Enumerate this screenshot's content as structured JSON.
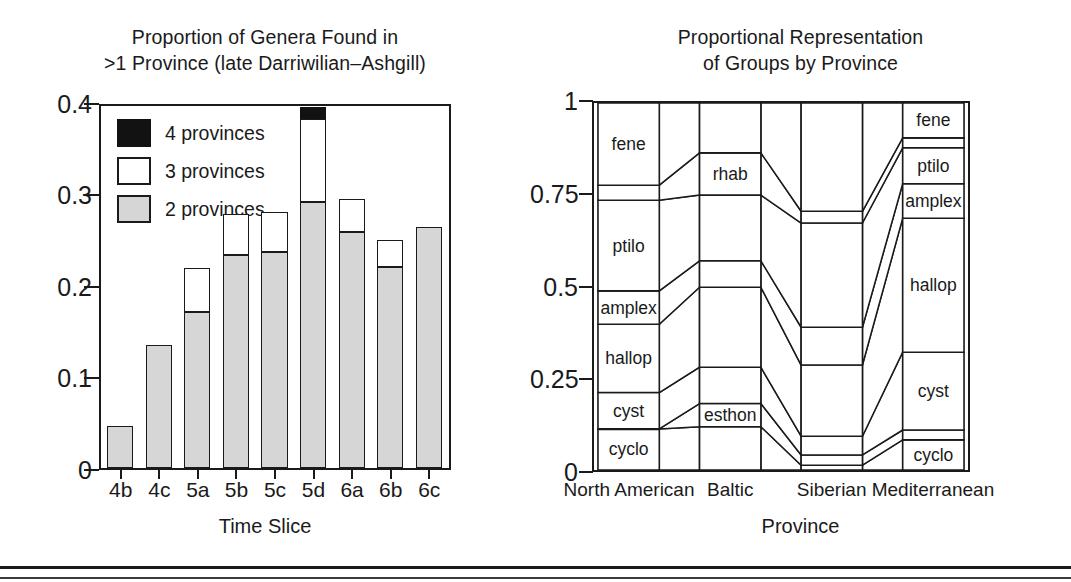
{
  "figure": {
    "panels": [
      "left-bar-chart",
      "right-mosaic-chart"
    ]
  },
  "left": {
    "title_line1": "Proportion of Genera Found in",
    "title_line2": ">1 Province (late Darriwilian–Ashgill)",
    "xlabel": "Time Slice",
    "yticks": [
      "0.4",
      "0.3",
      "0.2",
      "0.1",
      "0"
    ],
    "legend": [
      {
        "key": "g4",
        "label": "4 provinces",
        "color": "#121212"
      },
      {
        "key": "g3",
        "label": "3 provinces",
        "color": "#ffffff"
      },
      {
        "key": "g2",
        "label": "2 provinces",
        "color": "#d6d6d6"
      }
    ]
  },
  "right": {
    "title_line1": "Proportional Representation",
    "title_line2": "of Groups by Province",
    "xlabel": "Province",
    "yticks": [
      "1",
      "0.75",
      "0.5",
      "0.25",
      "0"
    ]
  },
  "chart_data": [
    {
      "type": "bar",
      "id": "proportion-of-genera",
      "title": "Proportion of Genera Found in >1 Province (late Darriwilian–Ashgill)",
      "xlabel": "Time Slice",
      "ylabel": "",
      "ylim": [
        0,
        0.4
      ],
      "yticks": [
        0,
        0.1,
        0.2,
        0.3,
        0.4
      ],
      "grid": false,
      "legend_position": "inside-top-left",
      "stacked": true,
      "categories": [
        "4b",
        "4c",
        "5a",
        "5b",
        "5c",
        "5d",
        "6a",
        "6b",
        "6c"
      ],
      "series": [
        {
          "name": "2 provinces",
          "color": "#d6d6d6",
          "values": [
            0.047,
            0.136,
            0.173,
            0.236,
            0.239,
            0.295,
            0.262,
            0.223,
            0.267
          ]
        },
        {
          "name": "3 provinces",
          "color": "#ffffff",
          "values": [
            0.0,
            0.0,
            0.049,
            0.045,
            0.045,
            0.092,
            0.036,
            0.03,
            0.0
          ]
        },
        {
          "name": "4 provinces",
          "color": "#121212",
          "values": [
            0.0,
            0.0,
            0.0,
            0.0,
            0.0,
            0.013,
            0.0,
            0.0,
            0.0
          ]
        }
      ],
      "totals": [
        0.047,
        0.136,
        0.222,
        0.281,
        0.284,
        0.4,
        0.298,
        0.253,
        0.267
      ]
    },
    {
      "type": "area",
      "id": "proportional-representation-of-groups",
      "title": "Proportional Representation of Groups by Province",
      "xlabel": "Province",
      "ylabel": "",
      "ylim": [
        0,
        1
      ],
      "yticks": [
        0,
        0.25,
        0.5,
        0.75,
        1
      ],
      "grid": false,
      "legend_position": "none",
      "note": "Stacked 100% composition per province, joined by ribbons; groups ordered bottom-to-top.",
      "categories": [
        "North American",
        "Baltic",
        "Siberian",
        "Mediterranean"
      ],
      "groups": [
        "cyclo",
        "esthon",
        "cyst",
        "hallop",
        "amplex",
        "ptilo",
        "rhab",
        "fene"
      ],
      "series": [
        {
          "name": "cyclo",
          "values": [
            0.112,
            0.118,
            0.013,
            0.082
          ]
        },
        {
          "name": "esthon",
          "values": [
            0.0,
            0.063,
            0.028,
            0.027
          ]
        },
        {
          "name": "cyst",
          "values": [
            0.099,
            0.099,
            0.051,
            0.212
          ]
        },
        {
          "name": "hallop",
          "values": [
            0.186,
            0.218,
            0.194,
            0.365
          ]
        },
        {
          "name": "amplex",
          "values": [
            0.091,
            0.072,
            0.103,
            0.094
          ]
        },
        {
          "name": "ptilo",
          "values": [
            0.247,
            0.179,
            0.284,
            0.098
          ]
        },
        {
          "name": "rhab",
          "values": [
            0.041,
            0.115,
            0.032,
            0.027
          ]
        },
        {
          "name": "fene",
          "values": [
            0.224,
            0.136,
            0.295,
            0.095
          ]
        }
      ],
      "labelled_cells": [
        {
          "province": "North American",
          "labels": [
            "fene",
            "ptilo",
            "amplex",
            "hallop",
            "cyst",
            "cyclo"
          ]
        },
        {
          "province": "Baltic",
          "labels": [
            "rhab",
            "esthon"
          ]
        },
        {
          "province": "Siberian",
          "labels": []
        },
        {
          "province": "Mediterranean",
          "labels": [
            "fene",
            "ptilo",
            "amplex",
            "hallop",
            "cyst",
            "cyclo"
          ]
        }
      ]
    }
  ]
}
